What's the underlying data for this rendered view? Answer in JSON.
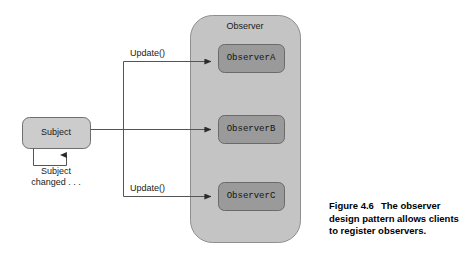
{
  "figure": {
    "type": "uml-observer-pattern-diagram",
    "background_color": "#ffffff"
  },
  "container": {
    "label": "Observer",
    "fill_color": "#c4c4c4",
    "stroke_color": "#8c8c8c"
  },
  "subject": {
    "label": "Subject",
    "fill_color": "#cccccc",
    "stroke_color": "#6e6e6e",
    "self_loop_label_line1": "Subject",
    "self_loop_label_line2": "changed . . ."
  },
  "observers": [
    {
      "label": "ObserverA",
      "fill_color": "#9a9a9a",
      "stroke_color": "#6a6a6a"
    },
    {
      "label": "ObserverB",
      "fill_color": "#9a9a9a",
      "stroke_color": "#6a6a6a"
    },
    {
      "label": "ObserverC",
      "fill_color": "#9a9a9a",
      "stroke_color": "#6a6a6a"
    }
  ],
  "edges": [
    {
      "name": "update-top",
      "label": "Update()",
      "from": "subject",
      "to": "ObserverA"
    },
    {
      "name": "update-middle",
      "label": "",
      "from": "subject",
      "to": "ObserverB"
    },
    {
      "name": "update-bottom",
      "label": "Update()",
      "from": "subject",
      "to": "ObserverC"
    }
  ],
  "caption": {
    "figure_number": "Figure 4.6",
    "text": "The observer design pattern allows clients to register observers."
  }
}
